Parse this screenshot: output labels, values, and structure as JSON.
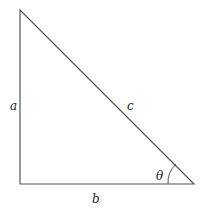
{
  "diagram": {
    "type": "right-triangle",
    "labels": {
      "a": "a",
      "b": "b",
      "c": "c",
      "theta": "θ"
    },
    "stroke_color": "#555555"
  }
}
